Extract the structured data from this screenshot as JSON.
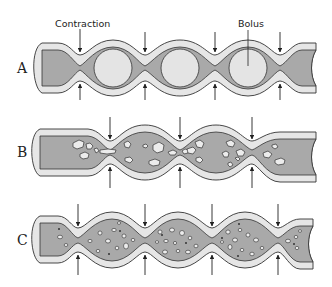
{
  "diagram": {
    "type": "peristalsis-vs-segmentation",
    "colors": {
      "wall": "#e6e6e6",
      "wall_stroke": "#333333",
      "lumen": "#a9a9a9",
      "bolus": "#e4e4e4",
      "particles": "#ececec",
      "arrow": "#222222",
      "background": "#ffffff"
    },
    "annotations": {
      "contraction": "Contraction",
      "bolus": "Bolus"
    },
    "rows": [
      {
        "label": "A",
        "contractions": 4,
        "content": "boluses",
        "bolus_count": 3
      },
      {
        "label": "B",
        "contractions": 3,
        "content": "fragmented chyme"
      },
      {
        "label": "C",
        "contractions": 4,
        "content": "fine particles"
      }
    ]
  }
}
